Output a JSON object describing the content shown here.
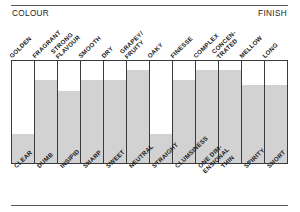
{
  "header": {
    "left_label": "COLOUR",
    "right_label": "FINISH"
  },
  "colors": {
    "bar_fill": "#d2d2d2",
    "frame_line": "#3a3a3c",
    "rule_line": "#58585a",
    "text": "#1b1b1b",
    "background": "#ffffff"
  },
  "chart_data": {
    "type": "bar",
    "title": "",
    "subtitle": "",
    "xlabel": "",
    "ylabel": "",
    "ylim": [
      0,
      100
    ],
    "grid": false,
    "legend": "none",
    "orientation": "vertical",
    "axis_top_label": "COLOUR",
    "axis_right_label": "FINISH",
    "categories": [
      "GOLDEN",
      "FRAGRANT",
      "STRONG\nFLAVOUR",
      "SMOOTH",
      "DRY",
      "GRAPEY/\nFRUITY",
      "OAKY",
      "FINESSE",
      "COMPLEX",
      "CONCEN-\nTRATED",
      "MELLOW",
      "LONG"
    ],
    "categories_negative": [
      "CLEAR",
      "DUMB",
      "INSIPID",
      "SHARP",
      "SWEET",
      "NEUTRAL",
      "STRAIGHT",
      "CLUMSINESS",
      "ONE DIM-\nENSIONAL",
      "THIN",
      "SPIRITY",
      "SHORT"
    ],
    "values": [
      28,
      81,
      71,
      81,
      81,
      91,
      28,
      81,
      91,
      91,
      76,
      76
    ],
    "series": [
      {
        "name": "tasting profile",
        "values": [
          28,
          81,
          71,
          81,
          81,
          91,
          28,
          81,
          91,
          91,
          76,
          76
        ]
      }
    ]
  },
  "columns": [
    {
      "top": "GOLDEN",
      "bottom": "CLEAR",
      "value": 28
    },
    {
      "top": "FRAGRANT",
      "bottom": "DUMB",
      "value": 81
    },
    {
      "top": "STRONG\nFLAVOUR",
      "bottom": "INSIPID",
      "value": 71
    },
    {
      "top": "SMOOTH",
      "bottom": "SHARP",
      "value": 81
    },
    {
      "top": "DRY",
      "bottom": "SWEET",
      "value": 81
    },
    {
      "top": "GRAPEY/\nFRUITY",
      "bottom": "NEUTRAL",
      "value": 91
    },
    {
      "top": "OAKY",
      "bottom": "STRAIGHT",
      "value": 28
    },
    {
      "top": "FINESSE",
      "bottom": "CLUMSINESS",
      "value": 81
    },
    {
      "top": "COMPLEX",
      "bottom": "ONE DIM-\nENSIONAL",
      "value": 91
    },
    {
      "top": "CONCEN-\nTRATED",
      "bottom": "THIN",
      "value": 91
    },
    {
      "top": "MELLOW",
      "bottom": "SPIRITY",
      "value": 76
    },
    {
      "top": "LONG",
      "bottom": "SHORT",
      "value": 76
    }
  ]
}
